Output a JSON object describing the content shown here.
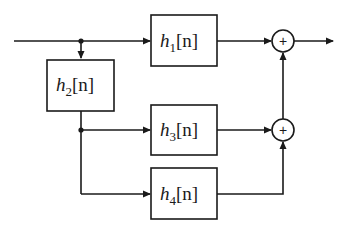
{
  "diagram": {
    "type": "block-diagram",
    "colors": {
      "stroke": "#1a1a1a",
      "background": "#ffffff"
    },
    "blocks": [
      {
        "id": "h1",
        "name": "h",
        "subscript": "1",
        "arg": "[n]"
      },
      {
        "id": "h2",
        "name": "h",
        "subscript": "2",
        "arg": "[n]"
      },
      {
        "id": "h3",
        "name": "h",
        "subscript": "3",
        "arg": "[n]"
      },
      {
        "id": "h4",
        "name": "h",
        "subscript": "4",
        "arg": "[n]"
      }
    ],
    "summers": [
      {
        "id": "sum-top",
        "symbol": "+"
      },
      {
        "id": "sum-bottom",
        "symbol": "+"
      }
    ],
    "connections": [
      "input -> junction-1",
      "junction-1 -> h1",
      "junction-1 -> h2",
      "h2 -> junction-2",
      "junction-2 -> h3",
      "junction-2 -> h4",
      "h1 -> sum-top",
      "h3 -> sum-bottom",
      "h4 -> sum-bottom",
      "sum-bottom -> sum-top",
      "sum-top -> output"
    ]
  }
}
